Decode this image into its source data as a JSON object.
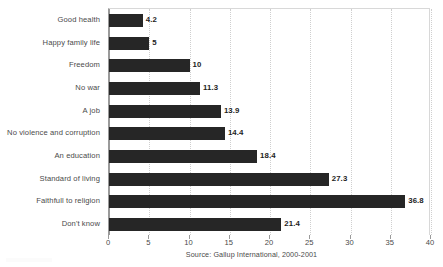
{
  "chart_data": {
    "type": "bar",
    "orientation": "horizontal",
    "title": "",
    "xlabel": "",
    "ylabel": "",
    "xlim": [
      0,
      40
    ],
    "xticks": [
      0,
      5,
      10,
      15,
      20,
      25,
      30,
      35,
      40
    ],
    "grid": true,
    "legend": false,
    "source_note": "Source: Gallup International, 2000-2001",
    "bar_color": "#262626",
    "categories": [
      "Good health",
      "Happy family life",
      "Freedom",
      "No war",
      "A job",
      "No violence and corruption",
      "An education",
      "Standard of living",
      "Faithfull to religion",
      "Don't know"
    ],
    "values": [
      4.2,
      5,
      10,
      11.3,
      13.9,
      14.4,
      18.4,
      27.3,
      36.8,
      21.4
    ],
    "value_labels": [
      "4.2",
      "5",
      "10",
      "11.3",
      "13.9",
      "14.4",
      "18.4",
      "27.3",
      "36.8",
      "21.4"
    ]
  }
}
